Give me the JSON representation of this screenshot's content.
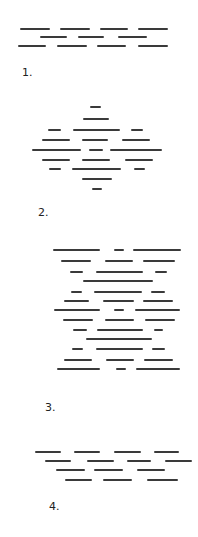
{
  "figures": [
    {
      "label": "1.",
      "label_pos": [
        22,
        67
      ],
      "rows": [
        {
          "y": 29,
          "segments": [
            [
              20,
              50
            ],
            [
              60,
              90
            ],
            [
              100,
              128
            ],
            [
              138,
              168
            ]
          ]
        },
        {
          "y": 37,
          "segments": [
            [
              40,
              67
            ],
            [
              78,
              104
            ],
            [
              118,
              147
            ]
          ]
        },
        {
          "y": 46,
          "segments": [
            [
              18,
              46
            ],
            [
              57,
              87
            ],
            [
              97,
              126
            ],
            [
              138,
              168
            ]
          ]
        }
      ]
    },
    {
      "label": "2.",
      "label_pos": [
        38,
        207
      ],
      "rows": [
        {
          "y": 107,
          "segments": [
            [
              90,
              101
            ]
          ]
        },
        {
          "y": 119,
          "segments": [
            [
              83,
              109
            ]
          ]
        },
        {
          "y": 130,
          "segments": [
            [
              48,
              61
            ],
            [
              73,
              120
            ],
            [
              131,
              143
            ]
          ]
        },
        {
          "y": 140,
          "segments": [
            [
              42,
              70
            ],
            [
              82,
              108
            ],
            [
              122,
              150
            ]
          ]
        },
        {
          "y": 150,
          "segments": [
            [
              32,
              81
            ],
            [
              89,
              103
            ],
            [
              110,
              162
            ]
          ]
        },
        {
          "y": 160,
          "segments": [
            [
              42,
              70
            ],
            [
              82,
              110
            ],
            [
              125,
              153
            ]
          ]
        },
        {
          "y": 169,
          "segments": [
            [
              49,
              61
            ],
            [
              72,
              121
            ],
            [
              134,
              145
            ]
          ]
        },
        {
          "y": 179,
          "segments": [
            [
              82,
              112
            ]
          ]
        },
        {
          "y": 189,
          "segments": [
            [
              92,
              102
            ]
          ]
        }
      ]
    },
    {
      "label": "3.",
      "label_pos": [
        45,
        402
      ],
      "rows": [
        {
          "y": 250,
          "segments": [
            [
              53,
              100
            ],
            [
              114,
              124
            ],
            [
              133,
              181
            ]
          ]
        },
        {
          "y": 261,
          "segments": [
            [
              61,
              91
            ],
            [
              105,
              133
            ],
            [
              143,
              175
            ]
          ]
        },
        {
          "y": 272,
          "segments": [
            [
              70,
              83
            ],
            [
              96,
              143
            ],
            [
              155,
              167
            ]
          ]
        },
        {
          "y": 281,
          "segments": [
            [
              83,
              153
            ]
          ]
        },
        {
          "y": 292,
          "segments": [
            [
              71,
              82
            ],
            [
              94,
              142
            ],
            [
              151,
              165
            ]
          ]
        },
        {
          "y": 301,
          "segments": [
            [
              64,
              89
            ],
            [
              103,
              134
            ],
            [
              143,
              173
            ]
          ]
        },
        {
          "y": 310,
          "segments": [
            [
              54,
              100
            ],
            [
              114,
              124
            ],
            [
              135,
              180
            ]
          ]
        },
        {
          "y": 320,
          "segments": [
            [
              63,
              93
            ],
            [
              105,
              134
            ],
            [
              145,
              175
            ]
          ]
        },
        {
          "y": 330,
          "segments": [
            [
              73,
              87
            ],
            [
              97,
              143
            ],
            [
              154,
              163
            ]
          ]
        },
        {
          "y": 339,
          "segments": [
            [
              86,
              152
            ]
          ]
        },
        {
          "y": 349,
          "segments": [
            [
              72,
              83
            ],
            [
              96,
              143
            ],
            [
              152,
              165
            ]
          ]
        },
        {
          "y": 360,
          "segments": [
            [
              64,
              92
            ],
            [
              106,
              134
            ],
            [
              144,
              173
            ]
          ]
        },
        {
          "y": 369,
          "segments": [
            [
              57,
              100
            ],
            [
              116,
              126
            ],
            [
              136,
              180
            ]
          ]
        }
      ]
    },
    {
      "label": "4.",
      "label_pos": [
        49,
        501
      ],
      "rows": [
        {
          "y": 452,
          "segments": [
            [
              35,
              61
            ],
            [
              74,
              100
            ],
            [
              114,
              141
            ],
            [
              154,
              179
            ]
          ]
        },
        {
          "y": 461,
          "segments": [
            [
              45,
              71
            ],
            [
              87,
              114
            ],
            [
              127,
              151
            ],
            [
              165,
              192
            ]
          ]
        },
        {
          "y": 470,
          "segments": [
            [
              56,
              85
            ],
            [
              94,
              123
            ],
            [
              137,
              165
            ]
          ]
        },
        {
          "y": 480,
          "segments": [
            [
              65,
              92
            ],
            [
              103,
              132
            ],
            [
              147,
              178
            ]
          ]
        }
      ]
    }
  ],
  "colors": {
    "stroke": "#3a3a3a",
    "background": "#ffffff",
    "label": "#222222"
  }
}
